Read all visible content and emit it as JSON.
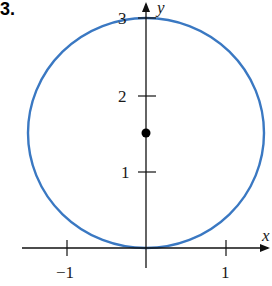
{
  "figure": {
    "problem_number": "3.",
    "axes": {
      "x_label": "x",
      "y_label": "y",
      "x_ticks": [
        {
          "value": -1,
          "label": "−1"
        },
        {
          "value": 1,
          "label": "1"
        }
      ],
      "y_ticks": [
        {
          "value": 1,
          "label": "1"
        },
        {
          "value": 2,
          "label": "2"
        },
        {
          "value": 3,
          "label": "3"
        }
      ]
    },
    "circle": {
      "center": [
        0,
        1.5
      ],
      "radius": 1.5,
      "color": "#3a78c2"
    },
    "point": {
      "x": 0,
      "y": 1.5,
      "color": "#000000"
    }
  }
}
